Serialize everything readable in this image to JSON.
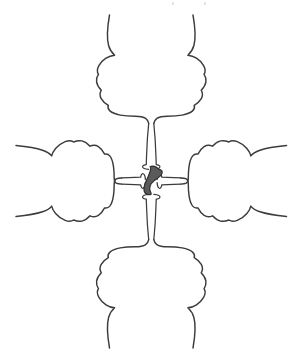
{
  "figure": {
    "title": "Cruciform four-lobed structure diagram",
    "background_color": "#ffffff",
    "line_color": "#3c3c3c",
    "core_fill_color": "#5a5a5a",
    "core_stroke_color": "#2e2e2e",
    "clipped_top_text": "i i",
    "canvas": {
      "width": 303,
      "height": 363
    }
  },
  "parts": {
    "top_lobe": {
      "label": "top-lobe",
      "orientation": "up"
    },
    "bottom_lobe": {
      "label": "bottom-lobe",
      "orientation": "down"
    },
    "left_lobe": {
      "label": "left-lobe",
      "orientation": "left"
    },
    "right_lobe": {
      "label": "right-lobe",
      "orientation": "right"
    },
    "top_tube": {
      "label": "top-connecting-tube"
    },
    "bottom_tube": {
      "label": "bottom-connecting-tube"
    },
    "left_tube": {
      "label": "left-connecting-tube"
    },
    "right_tube": {
      "label": "right-connecting-tube"
    },
    "core": {
      "label": "central-stained-body"
    }
  }
}
